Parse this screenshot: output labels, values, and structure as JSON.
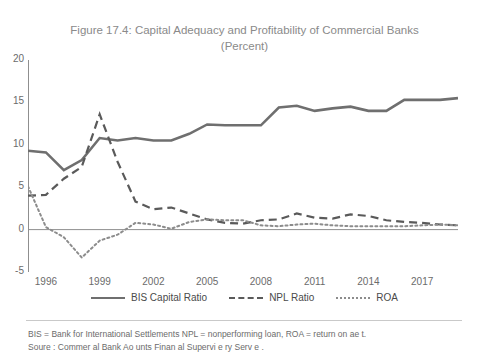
{
  "title_line1": "Figure 17.4: Capital Adequacy and Profitability of Commercial Banks",
  "title_line2": "(Percent)",
  "legend": [
    {
      "label": "BIS Capital Ratio",
      "style": "solid",
      "color": "#6f6f6f"
    },
    {
      "label": "NPL Ratio",
      "style": "dashed",
      "color": "#5a5a5a"
    },
    {
      "label": "ROA",
      "style": "dotted",
      "color": "#8c8c8c"
    }
  ],
  "footnote_line1": "BIS = Bank for International Settlements  NPL = nonperforming loan, ROA = return on ae   t.",
  "footnote_line2": "Soure  : Commer  al Bank Ao    unts  Finan  al Supervi e  ry Serv  e   .",
  "chart_data": {
    "type": "line",
    "title": "Figure 17.4: Capital Adequacy and Profitability of Commercial Banks (Percent)",
    "xlabel": "",
    "ylabel": "",
    "ylim": [
      -5,
      20
    ],
    "yticks": [
      -5,
      0,
      5,
      10,
      15,
      20
    ],
    "xlim": [
      1995,
      2019
    ],
    "xticks": [
      1996,
      1999,
      2002,
      2005,
      2008,
      2011,
      2014,
      2017
    ],
    "x": [
      1995,
      1996,
      1997,
      1998,
      1999,
      2000,
      2001,
      2002,
      2003,
      2004,
      2005,
      2006,
      2007,
      2008,
      2009,
      2010,
      2011,
      2012,
      2013,
      2014,
      2015,
      2016,
      2017,
      2018,
      2019
    ],
    "grid": false,
    "legend_position": "bottom",
    "series": [
      {
        "name": "BIS Capital Ratio",
        "style": "solid",
        "color": "#6f6f6f",
        "values": [
          9.3,
          9.1,
          7.0,
          8.2,
          10.8,
          10.5,
          10.8,
          10.5,
          10.5,
          11.3,
          12.4,
          12.3,
          12.3,
          12.3,
          14.4,
          14.6,
          14.0,
          14.3,
          14.5,
          14.0,
          14.0,
          15.3,
          15.3,
          15.3,
          15.5
        ]
      },
      {
        "name": "NPL Ratio",
        "style": "dashed",
        "color": "#5a5a5a",
        "values": [
          4.0,
          4.1,
          6.0,
          7.4,
          13.6,
          8.0,
          3.3,
          2.4,
          2.6,
          1.9,
          1.2,
          0.8,
          0.7,
          1.1,
          1.2,
          1.9,
          1.4,
          1.3,
          1.8,
          1.6,
          1.1,
          0.9,
          0.8,
          0.6,
          0.5
        ]
      },
      {
        "name": "ROA",
        "style": "dotted",
        "color": "#8c8c8c",
        "values": [
          5.1,
          0.3,
          -0.9,
          -3.3,
          -1.3,
          -0.6,
          0.8,
          0.6,
          0.1,
          0.9,
          1.2,
          1.1,
          1.1,
          0.5,
          0.4,
          0.6,
          0.7,
          0.5,
          0.4,
          0.4,
          0.4,
          0.4,
          0.5,
          0.6,
          0.5
        ]
      }
    ]
  }
}
